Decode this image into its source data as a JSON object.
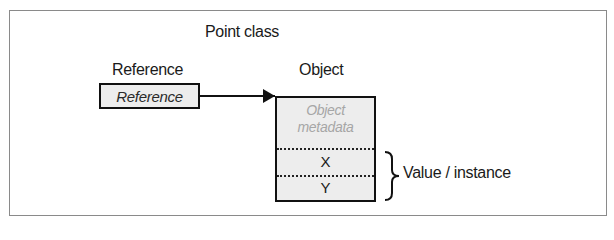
{
  "diagram": {
    "title": "Point class",
    "reference": {
      "heading": "Reference",
      "box_label": "Reference"
    },
    "object": {
      "heading": "Object",
      "metadata_line1": "Object",
      "metadata_line2": "metadata",
      "fields": [
        "X",
        "Y"
      ]
    },
    "brace_label": "Value / instance",
    "colors": {
      "box_fill": "#ededed",
      "border": "#111111",
      "metadata_text": "#a6a6a6",
      "frame": "#8a8a8a"
    }
  }
}
